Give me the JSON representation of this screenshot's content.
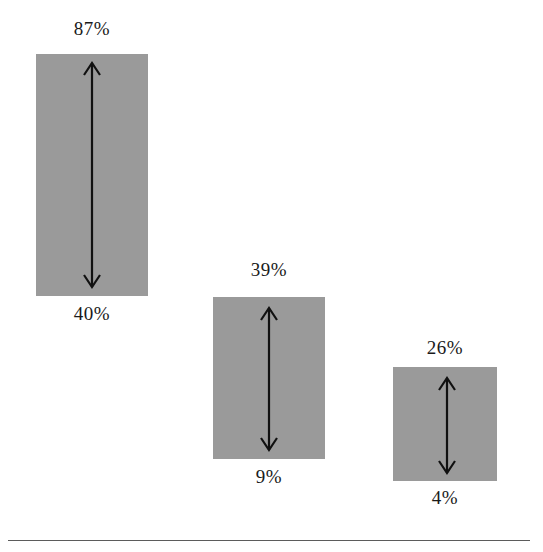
{
  "chart_data": {
    "type": "bar",
    "title": "",
    "subtitle": "",
    "xlabel": "",
    "ylabel": "",
    "grid": false,
    "legend": null,
    "orientation": "vertical",
    "bar_style": "floating range bars with double-headed vertical arrows",
    "categories": [
      "Category 1",
      "Category 2",
      "Category 3"
    ],
    "series": [
      {
        "name": "Range high",
        "values": [
          87,
          39,
          26
        ]
      },
      {
        "name": "Range low",
        "values": [
          40,
          9,
          4
        ]
      }
    ],
    "ranges": [
      {
        "low": 40,
        "high": 87,
        "span": 47
      },
      {
        "low": 9,
        "high": 39,
        "span": 30
      },
      {
        "low": 4,
        "high": 26,
        "span": 22
      }
    ],
    "value_unit": "%",
    "ylim": [
      0,
      100
    ]
  },
  "bars": [
    {
      "id": "bar-1",
      "upper_label": "87%",
      "lower_label": "40%",
      "upper_value": 87,
      "lower_value": 40,
      "geometry": {
        "x": 36,
        "y": 54,
        "w": 112,
        "h": 242
      },
      "arrow": {
        "cx": 92,
        "top": 62,
        "bottom": 288
      },
      "upper_label_pos": {
        "x": 12,
        "y": 18
      },
      "lower_label_pos": {
        "x": 12,
        "y": 303
      }
    },
    {
      "id": "bar-2",
      "upper_label": "39%",
      "lower_label": "9%",
      "upper_value": 39,
      "lower_value": 9,
      "geometry": {
        "x": 213,
        "y": 297,
        "w": 112,
        "h": 162
      },
      "arrow": {
        "cx": 269,
        "top": 307,
        "bottom": 451
      },
      "upper_label_pos": {
        "x": 189,
        "y": 259
      },
      "lower_label_pos": {
        "x": 189,
        "y": 466
      }
    },
    {
      "id": "bar-3",
      "upper_label": "26%",
      "lower_label": "4%",
      "upper_value": 26,
      "lower_value": 4,
      "geometry": {
        "x": 393,
        "y": 367,
        "w": 104,
        "h": 114
      },
      "arrow": {
        "cx": 447,
        "top": 377,
        "bottom": 474
      },
      "upper_label_pos": {
        "x": 365,
        "y": 337,
        "t": 1
      },
      "lower_label_pos": {
        "x": 365,
        "y": 487
      }
    }
  ],
  "baseline": {
    "x": 8,
    "y": 540,
    "width": 522
  },
  "colors": {
    "bar_fill": "#9a9a9a",
    "arrow": "#111111",
    "label_text": "#1a1a1a",
    "baseline_rule": "#5b5b5b",
    "background": "#ffffff"
  }
}
